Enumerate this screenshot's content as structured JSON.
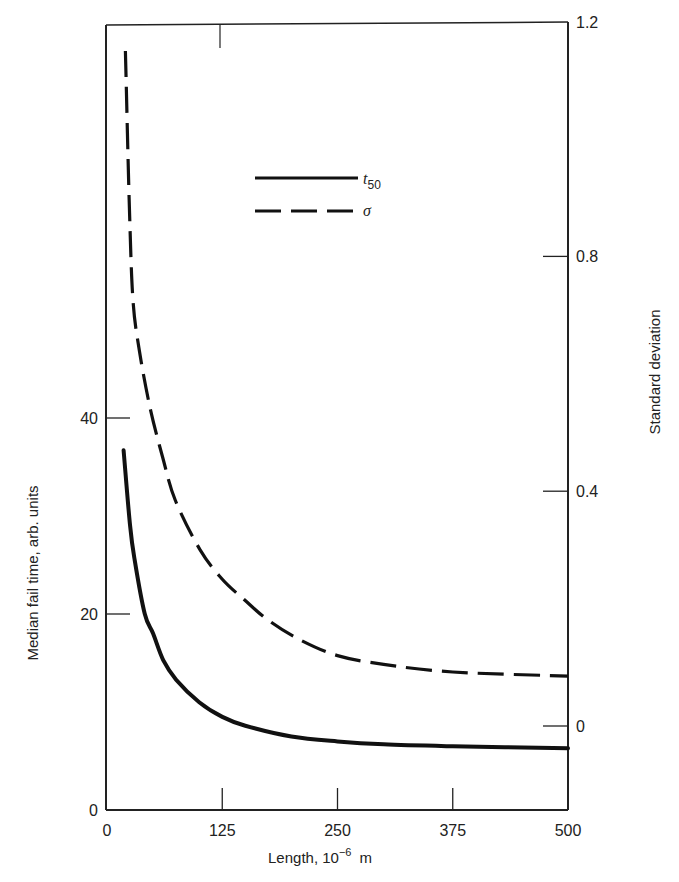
{
  "chart_data": {
    "type": "line",
    "title": "",
    "xlabel": "Length, 10⁻⁶ m",
    "ylabel": "Median fail time, arb. units",
    "y2label": "Standard deviation",
    "xlim": [
      0,
      500
    ],
    "ylim": [
      0,
      50
    ],
    "y2lim": [
      -0.17,
      1.2
    ],
    "x_ticks": [
      0,
      125,
      250,
      375,
      500
    ],
    "y_ticks": [
      0,
      20,
      40
    ],
    "y2_ticks": [
      0,
      0.4,
      0.8,
      1.2
    ],
    "grid": false,
    "legend_position": "upper center",
    "series": [
      {
        "name": "t50",
        "axis": "left",
        "style": "solid",
        "x": [
          18,
          25,
          30,
          41,
          50,
          61,
          75,
          100,
          125,
          150,
          200,
          250,
          300,
          375,
          500
        ],
        "values": [
          36.7,
          29.0,
          25.5,
          20.0,
          18.0,
          15.3,
          13.3,
          11.0,
          9.5,
          8.6,
          7.5,
          7.0,
          6.7,
          6.5,
          6.3
        ]
      },
      {
        "name": "σ",
        "axis": "right",
        "style": "dashed",
        "x": [
          20,
          24,
          28,
          35,
          47,
          60,
          74,
          101,
          125,
          149,
          175,
          209,
          250,
          300,
          375,
          500
        ],
        "values": [
          1.15,
          0.9,
          0.73,
          0.64,
          0.54,
          0.46,
          0.385,
          0.3,
          0.25,
          0.215,
          0.18,
          0.147,
          0.12,
          0.105,
          0.092,
          0.085
        ]
      }
    ]
  },
  "legend": {
    "items": [
      {
        "label": "t",
        "sub": "50",
        "style": "solid"
      },
      {
        "label": "σ",
        "sub": "",
        "style": "dashed"
      }
    ]
  },
  "axes": {
    "x_title": "Length, 10",
    "x_title_exp": "−6",
    "x_title_unit": "m",
    "y_title": "Median fail time, arb. units",
    "y2_title": "Standard deviation",
    "x_tick_labels": [
      "0",
      "125",
      "250",
      "375",
      "500"
    ],
    "y_tick_labels": [
      "0",
      "20",
      "40"
    ],
    "y2_tick_labels": [
      "0",
      "0.4",
      "0.8",
      "1.2"
    ]
  },
  "colors": {
    "line": "#111111",
    "axis": "#222222",
    "background": "#ffffff"
  }
}
